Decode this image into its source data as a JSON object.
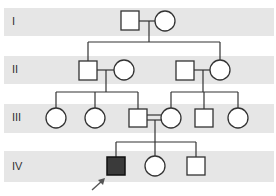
{
  "pedigree": {
    "generations": [
      {
        "label": "I",
        "band_top": 8,
        "band_height": 28
      },
      {
        "label": "II",
        "band_top": 56,
        "band_height": 28
      },
      {
        "label": "III",
        "band_top": 104,
        "band_height": 29
      },
      {
        "label": "IV",
        "band_top": 151,
        "band_height": 31
      }
    ],
    "individuals": [
      {
        "id": "I-1",
        "generation": "I",
        "sex": "male",
        "affected": false
      },
      {
        "id": "I-2",
        "generation": "I",
        "sex": "female",
        "affected": false
      },
      {
        "id": "II-1",
        "generation": "II",
        "sex": "male",
        "affected": false
      },
      {
        "id": "II-2",
        "generation": "II",
        "sex": "female",
        "affected": false
      },
      {
        "id": "II-3",
        "generation": "II",
        "sex": "male",
        "affected": false
      },
      {
        "id": "II-4",
        "generation": "II",
        "sex": "female",
        "affected": false
      },
      {
        "id": "III-1",
        "generation": "III",
        "sex": "female",
        "affected": false
      },
      {
        "id": "III-2",
        "generation": "III",
        "sex": "female",
        "affected": false
      },
      {
        "id": "III-3",
        "generation": "III",
        "sex": "male",
        "affected": false
      },
      {
        "id": "III-4",
        "generation": "III",
        "sex": "female",
        "affected": false
      },
      {
        "id": "III-5",
        "generation": "III",
        "sex": "male",
        "affected": false
      },
      {
        "id": "III-6",
        "generation": "III",
        "sex": "female",
        "affected": false
      },
      {
        "id": "IV-1",
        "generation": "IV",
        "sex": "male",
        "affected": true,
        "proband": true
      },
      {
        "id": "IV-2",
        "generation": "IV",
        "sex": "female",
        "affected": false
      },
      {
        "id": "IV-3",
        "generation": "IV",
        "sex": "male",
        "affected": false
      }
    ],
    "unions": [
      {
        "partners": [
          "I-1",
          "I-2"
        ],
        "consanguineous": false,
        "children": [
          "II-1",
          "II-4"
        ]
      },
      {
        "partners": [
          "II-1",
          "II-2"
        ],
        "consanguineous": false,
        "children": [
          "III-1",
          "III-2",
          "III-3"
        ]
      },
      {
        "partners": [
          "II-3",
          "II-4"
        ],
        "consanguineous": false,
        "children": [
          "III-4",
          "III-5",
          "III-6"
        ]
      },
      {
        "partners": [
          "III-3",
          "III-4"
        ],
        "consanguineous": true,
        "children": [
          "IV-1",
          "IV-2",
          "IV-3"
        ]
      }
    ],
    "colors": {
      "band": "#e6e6e6",
      "line": "#333333",
      "affected_fill": "#3a3a3a",
      "unaffected_fill": "#ffffff",
      "arrow": "#555555"
    }
  }
}
